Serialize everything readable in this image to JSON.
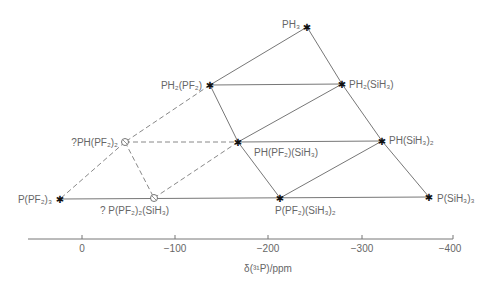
{
  "diagram": {
    "title": "",
    "axis": {
      "label": "δ(³¹P)/ppm",
      "ticks": [
        {
          "value": 0,
          "label": "0",
          "x": 82
        },
        {
          "value": -100,
          "label": "−100",
          "x": 175
        },
        {
          "value": -200,
          "label": "−200",
          "x": 268
        },
        {
          "value": -300,
          "label": "−300",
          "x": 362
        },
        {
          "value": -400,
          "label": "−400",
          "x": 453
        }
      ]
    },
    "nodes": [
      {
        "id": "PH3",
        "label": "PH₃",
        "x": 307,
        "y": 27,
        "marker": "star",
        "tentative": false
      },
      {
        "id": "PH2PF2",
        "label": "PH₂(PF₂)",
        "x": 210,
        "y": 85,
        "marker": "star",
        "tentative": false
      },
      {
        "id": "PH2SiH3",
        "label": "PH₂(SiH₃)",
        "x": 342,
        "y": 84,
        "marker": "star",
        "tentative": false
      },
      {
        "id": "PHPF2_2",
        "label": "?PH(PF₂)₂",
        "x": 125,
        "y": 142,
        "marker": "circle",
        "tentative": true
      },
      {
        "id": "PHPF2SiH3",
        "label": "PH(PF₂)(SiH₃)",
        "x": 238,
        "y": 142,
        "marker": "star",
        "tentative": false
      },
      {
        "id": "PHSiH3_2",
        "label": "PH(SiH₃)₂",
        "x": 382,
        "y": 141,
        "marker": "star",
        "tentative": false
      },
      {
        "id": "PPF2_3",
        "label": "P(PF₂)₃",
        "x": 60,
        "y": 199,
        "marker": "star",
        "tentative": false
      },
      {
        "id": "PPF2_2SiH3",
        "label": "? P(PF₂)₂(SiH₃)",
        "x": 154,
        "y": 198,
        "marker": "circle",
        "tentative": true
      },
      {
        "id": "PPF2SiH3_2",
        "label": "P(PF₂)(SiH₃)₂",
        "x": 280,
        "y": 198,
        "marker": "star",
        "tentative": false
      },
      {
        "id": "PSiH3_3",
        "label": "P(SiH₃)₃",
        "x": 429,
        "y": 197,
        "marker": "star",
        "tentative": false
      }
    ],
    "edges": [
      {
        "from": "PH3",
        "to": "PH2PF2",
        "style": "solid"
      },
      {
        "from": "PH3",
        "to": "PH2SiH3",
        "style": "solid"
      },
      {
        "from": "PH2PF2",
        "to": "PH2SiH3",
        "style": "solid"
      },
      {
        "from": "PH2PF2",
        "to": "PHPF2SiH3",
        "style": "solid"
      },
      {
        "from": "PH2SiH3",
        "to": "PHPF2SiH3",
        "style": "solid"
      },
      {
        "from": "PH2SiH3",
        "to": "PHSiH3_2",
        "style": "solid"
      },
      {
        "from": "PHPF2SiH3",
        "to": "PHSiH3_2",
        "style": "solid"
      },
      {
        "from": "PHPF2SiH3",
        "to": "PPF2SiH3_2",
        "style": "solid"
      },
      {
        "from": "PHSiH3_2",
        "to": "PPF2SiH3_2",
        "style": "solid"
      },
      {
        "from": "PHSiH3_2",
        "to": "PSiH3_3",
        "style": "solid"
      },
      {
        "from": "PPF2SiH3_2",
        "to": "PSiH3_3",
        "style": "solid"
      },
      {
        "from": "PPF2_3",
        "to": "PPF2_2SiH3",
        "style": "solid"
      },
      {
        "from": "PPF2_2SiH3",
        "to": "PPF2SiH3_2",
        "style": "solid"
      },
      {
        "from": "PH2PF2",
        "to": "PHPF2_2",
        "style": "dashed"
      },
      {
        "from": "PHPF2_2",
        "to": "PPF2_3",
        "style": "dashed"
      },
      {
        "from": "PHPF2_2",
        "to": "PHPF2SiH3",
        "style": "dashed"
      },
      {
        "from": "PHPF2_2",
        "to": "PPF2_2SiH3",
        "style": "dashed"
      },
      {
        "from": "PPF2_2SiH3",
        "to": "PHPF2SiH3",
        "style": "dashed"
      }
    ]
  },
  "labels": {
    "PH3": "PH₃",
    "PH2PF2": "PH₂(PF₂)",
    "PH2SiH3": "PH₂(SiH₃)",
    "PHPF2_2": "?PH(PF₂)₂",
    "PHPF2SiH3": "PH(PF₂)(SiH₃)",
    "PHSiH3_2": "PH(SiH₃)₂",
    "PPF2_3": "P(PF₂)₃",
    "PPF2_2SiH3": "? P(PF₂)₂(SiH₃)",
    "PPF2SiH3_2": "P(PF₂)(SiH₃)₂",
    "PSiH3_3": "P(SiH₃)₃",
    "tick0": "0",
    "tick100": "−100",
    "tick200": "−200",
    "tick300": "−300",
    "tick400": "−400",
    "axis_label": "δ(³¹P)/ppm"
  }
}
